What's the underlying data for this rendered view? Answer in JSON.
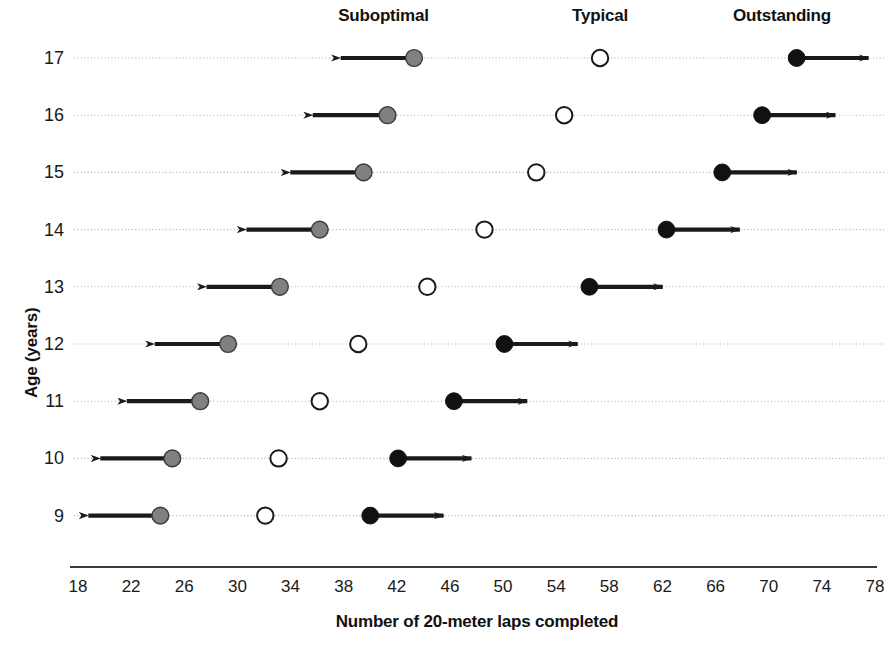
{
  "chart_data": {
    "type": "scatter",
    "title": "",
    "xlabel": "Number of 20-meter laps completed",
    "ylabel": "Age (years)",
    "xlim": [
      18,
      78
    ],
    "xticks": [
      18,
      22,
      26,
      30,
      34,
      38,
      42,
      46,
      50,
      54,
      58,
      62,
      66,
      70,
      74,
      78
    ],
    "yticks": [
      17,
      16,
      15,
      14,
      13,
      12,
      11,
      10,
      9
    ],
    "grid": true,
    "legend_position": "top",
    "band_labels": [
      {
        "label": "Suboptimal",
        "x": 41
      },
      {
        "label": "Typical",
        "x": 57.3
      },
      {
        "label": "Outstanding",
        "x": 71
      }
    ],
    "series": [
      {
        "name": "Suboptimal",
        "marker": "gray-filled-circle",
        "color": "#808080",
        "arrow": "left"
      },
      {
        "name": "Typical",
        "marker": "open-circle",
        "color": "#ffffff",
        "arrow": "none"
      },
      {
        "name": "Outstanding",
        "marker": "black-filled-circle",
        "color": "#111111",
        "arrow": "right"
      }
    ],
    "rows": [
      {
        "age": 17,
        "suboptimal": 43.3,
        "suboptimal_arrow_end": 37.1,
        "typical": 57.3,
        "outstanding": 72.1,
        "outstanding_arrow_end": 78.2
      },
      {
        "age": 16,
        "suboptimal": 41.3,
        "suboptimal_arrow_end": 35.0,
        "typical": 54.6,
        "outstanding": 69.5,
        "outstanding_arrow_end": 75.7
      },
      {
        "age": 15,
        "suboptimal": 39.5,
        "suboptimal_arrow_end": 33.3,
        "typical": 52.5,
        "outstanding": 66.5,
        "outstanding_arrow_end": 72.8
      },
      {
        "age": 14,
        "suboptimal": 36.2,
        "suboptimal_arrow_end": 30.0,
        "typical": 48.6,
        "outstanding": 62.3,
        "outstanding_arrow_end": 68.5
      },
      {
        "age": 13,
        "suboptimal": 33.2,
        "suboptimal_arrow_end": 27.0,
        "typical": 44.3,
        "outstanding": 56.5,
        "outstanding_arrow_end": 62.7
      },
      {
        "age": 12,
        "suboptimal": 29.3,
        "suboptimal_arrow_end": 23.1,
        "typical": 39.1,
        "outstanding": 50.1,
        "outstanding_arrow_end": 56.3
      },
      {
        "age": 11,
        "suboptimal": 27.2,
        "suboptimal_arrow_end": 21.0,
        "typical": 36.2,
        "outstanding": 46.3,
        "outstanding_arrow_end": 52.5
      },
      {
        "age": 10,
        "suboptimal": 25.1,
        "suboptimal_arrow_end": 19.0,
        "typical": 33.1,
        "outstanding": 42.1,
        "outstanding_arrow_end": 48.3
      },
      {
        "age": 9,
        "suboptimal": 24.2,
        "suboptimal_arrow_end": 18.1,
        "typical": 32.1,
        "outstanding": 40.0,
        "outstanding_arrow_end": 46.2
      }
    ]
  },
  "colors": {
    "suboptimal_marker": "#808080",
    "typical_marker": "#ffffff",
    "outstanding_marker": "#111111",
    "arrow": "#1a1a1a",
    "gridline": "#b0b0b0",
    "axis": "#3a3a3a"
  }
}
